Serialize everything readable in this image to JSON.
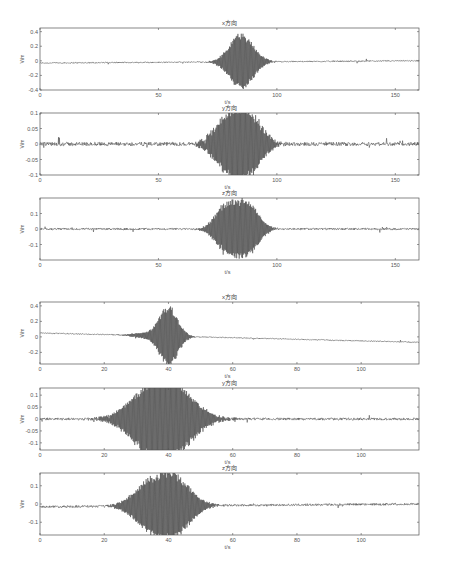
{
  "chart_data": [
    {
      "type": "line",
      "title": "x方向",
      "xlabel": "t/s",
      "ylabel": "V/m",
      "xlim": [
        0,
        160
      ],
      "ylim": [
        -0.4,
        0.45
      ],
      "xticks": [
        0,
        50,
        100,
        150
      ],
      "yticks": [
        0.4,
        0.2,
        0,
        -0.2,
        -0.4
      ],
      "ytick_labels": [
        "0.4",
        "0.2",
        "0",
        "-0.2",
        "-0.4"
      ],
      "grid": false,
      "description": "Low-level noise with a single wave packet peaking at ~0.4 near t≈85 s; slight negative offset (~-0.03) at start",
      "packets": [
        {
          "center": 85,
          "halfwidth": 7,
          "amp": 0.4
        }
      ],
      "baseline_start": -0.03,
      "baseline_end": 0.0,
      "noise": 0.008
    },
    {
      "type": "line",
      "title": "y方向",
      "xlabel": "t/s",
      "ylabel": "V/m",
      "xlim": [
        0,
        160
      ],
      "ylim": [
        -0.1,
        0.1
      ],
      "xticks": [
        0,
        50,
        100,
        150
      ],
      "yticks": [
        0.1,
        0.05,
        0,
        -0.05,
        -0.1
      ],
      "ytick_labels": [
        "0.1",
        "0.05",
        "0",
        "-0.05",
        "-0.1"
      ],
      "grid": false,
      "description": "Two adjacent wave packets at t≈79 s and t≈88 s reaching ~±0.09, with spiky noise elsewhere",
      "packets": [
        {
          "center": 79,
          "halfwidth": 8,
          "amp": 0.08
        },
        {
          "center": 88,
          "halfwidth": 8,
          "amp": 0.095
        }
      ],
      "baseline_start": 0,
      "baseline_end": 0,
      "noise": 0.006
    },
    {
      "type": "line",
      "title": "z方向",
      "xlabel": "t/s",
      "ylabel": "V/m",
      "xlim": [
        0,
        160
      ],
      "ylim": [
        -0.2,
        0.2
      ],
      "xticks": [
        0,
        50,
        100,
        150
      ],
      "yticks": [
        0.1,
        0,
        -0.1
      ],
      "ytick_labels": [
        "0.1",
        "0",
        "-0.1"
      ],
      "grid": false,
      "description": "Two adjacent wave packets at t≈78 s and t≈87 s reaching ~±0.17",
      "packets": [
        {
          "center": 78,
          "halfwidth": 6,
          "amp": 0.14
        },
        {
          "center": 87,
          "halfwidth": 7,
          "amp": 0.18
        }
      ],
      "baseline_start": 0,
      "baseline_end": 0,
      "noise": 0.006
    },
    {
      "type": "line",
      "title": "x方向",
      "xlabel": "t/s",
      "ylabel": "V/m",
      "xlim": [
        0,
        118
      ],
      "ylim": [
        -0.35,
        0.45
      ],
      "xticks": [
        0,
        20,
        40,
        60,
        80,
        100
      ],
      "yticks": [
        0.4,
        0.2,
        0,
        -0.2
      ],
      "ytick_labels": [
        "0.4",
        "0.2",
        "0",
        "-0.2"
      ],
      "grid": false,
      "description": "Baseline drifting from ~0.05 down to ~-0.07; a precursor packet near t≈32 s and main packet peaking ~0.4 at t≈40 s",
      "packets": [
        {
          "center": 32,
          "halfwidth": 5,
          "amp": 0.03
        },
        {
          "center": 40,
          "halfwidth": 4,
          "amp": 0.4
        }
      ],
      "baseline_start": 0.05,
      "baseline_end": -0.07,
      "noise": 0.006
    },
    {
      "type": "line",
      "title": "y方向",
      "xlabel": "t/s",
      "ylabel": "V/m",
      "xlim": [
        0,
        118
      ],
      "ylim": [
        -0.13,
        0.13
      ],
      "xticks": [
        0,
        20,
        40,
        60,
        80,
        100
      ],
      "yticks": [
        0.1,
        0.05,
        0,
        -0.05,
        -0.1
      ],
      "ytick_labels": [
        "0.1",
        "0.05",
        "0",
        "-0.05",
        "-0.1"
      ],
      "grid": false,
      "description": "Two broad wave packets at t≈34 s and t≈42 s with ~±0.12 amplitude, spiky noise after t≈60 s",
      "packets": [
        {
          "center": 34,
          "halfwidth": 9,
          "amp": 0.115
        },
        {
          "center": 42,
          "halfwidth": 9,
          "amp": 0.12
        }
      ],
      "baseline_start": 0,
      "baseline_end": 0,
      "noise": 0.005
    },
    {
      "type": "line",
      "title": "z方向",
      "xlabel": "t/s",
      "ylabel": "V/m",
      "xlim": [
        0,
        118
      ],
      "ylim": [
        -0.17,
        0.17
      ],
      "xticks": [
        0,
        20,
        40,
        60,
        80,
        100
      ],
      "yticks": [
        0.1,
        0,
        -0.1
      ],
      "ytick_labels": [
        "0.1",
        "0",
        "-0.1"
      ],
      "grid": false,
      "description": "Two wave packets at t≈34 s and t≈42 s reaching ~±0.13 and ~±0.16; baseline slightly negative at start",
      "packets": [
        {
          "center": 34,
          "halfwidth": 7,
          "amp": 0.12
        },
        {
          "center": 42,
          "halfwidth": 7,
          "amp": 0.155
        }
      ],
      "baseline_start": -0.015,
      "baseline_end": 0,
      "noise": 0.006
    }
  ],
  "layout": [
    {
      "left": 40,
      "top": 28,
      "width": 170,
      "height": 60,
      "right": 419
    },
    {
      "left": 40,
      "top": 113,
      "width": 170,
      "height": 60,
      "right": 419
    },
    {
      "left": 40,
      "top": 198,
      "width": 170,
      "height": 60,
      "right": 419
    },
    {
      "left": 40,
      "top": 302,
      "width": 170,
      "height": 60,
      "right": 419
    },
    {
      "left": 40,
      "top": 388,
      "width": 170,
      "height": 60,
      "right": 419
    },
    {
      "left": 40,
      "top": 473,
      "width": 170,
      "height": 60,
      "right": 419
    }
  ]
}
